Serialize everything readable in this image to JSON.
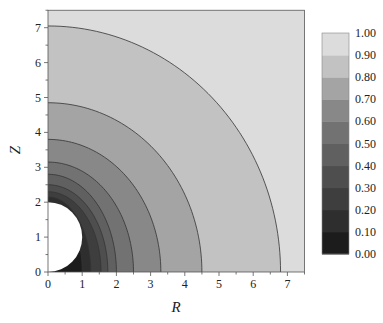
{
  "chart_data": {
    "type": "contour",
    "title": "",
    "xlabel": "R",
    "ylabel": "Z",
    "xlim": [
      0,
      7.5
    ],
    "ylim": [
      0,
      7.5
    ],
    "xticks": [
      "0",
      "1",
      "2",
      "3",
      "4",
      "5",
      "6",
      "7"
    ],
    "yticks": [
      "0",
      "1",
      "2",
      "3",
      "4",
      "5",
      "6",
      "7"
    ],
    "grid": false,
    "hole": {
      "shape": "semicircle",
      "center_r": 0,
      "center_z": 1,
      "radius": 1
    },
    "contour_levels": [
      0.1,
      0.2,
      0.3,
      0.4,
      0.5,
      0.6,
      0.7,
      0.8,
      0.9
    ],
    "contours": [
      {
        "level": 0.1,
        "r_intercept": 1.0,
        "z_intercept": 2.0
      },
      {
        "level": 0.2,
        "r_intercept": 1.25,
        "z_intercept": 2.15
      },
      {
        "level": 0.3,
        "r_intercept": 1.55,
        "z_intercept": 2.3
      },
      {
        "level": 0.4,
        "r_intercept": 1.75,
        "z_intercept": 2.5
      },
      {
        "level": 0.5,
        "r_intercept": 2.0,
        "z_intercept": 2.8
      },
      {
        "level": 0.6,
        "r_intercept": 2.5,
        "z_intercept": 3.15
      },
      {
        "level": 0.7,
        "r_intercept": 3.3,
        "z_intercept": 3.8
      },
      {
        "level": 0.8,
        "r_intercept": 4.5,
        "z_intercept": 4.85
      },
      {
        "level": 0.9,
        "r_intercept": 6.8,
        "z_intercept": 7.05
      }
    ],
    "colorbar": {
      "position": "right",
      "ticks": [
        "1.00",
        "0.90",
        "0.80",
        "0.70",
        "0.60",
        "0.50",
        "0.40",
        "0.30",
        "0.20",
        "0.10",
        "0.00"
      ],
      "colors": [
        "#1c1c1c",
        "#2e2e2e",
        "#3e3e3e",
        "#4e4e4e",
        "#606060",
        "#727272",
        "#888888",
        "#a4a4a4",
        "#c2c2c2",
        "#dcdcdc",
        "#ffffff"
      ]
    }
  }
}
